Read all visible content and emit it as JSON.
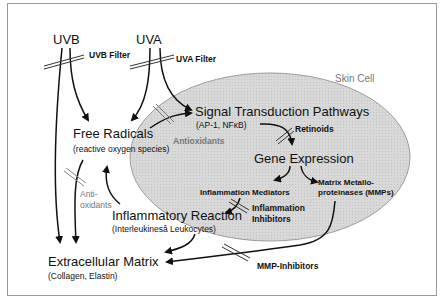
{
  "diagram": {
    "container_label": "Skin Cell",
    "colors": {
      "cell_fill": "#d6d6d6",
      "cell_stroke": "#9c9c9c",
      "arrow": "#111111",
      "inhibitor_text": "#222222",
      "antioxidant_text": "#7a7a7a"
    },
    "sources": {
      "uvb": "UVB",
      "uva": "UVA"
    },
    "nodes": {
      "free_radicals": {
        "title": "Free Radicals",
        "subtitle": "(reactive oxygen species)"
      },
      "signal_transduction": {
        "title": "Signal Transduction Pathways",
        "subtitle": "(AP-1, NFκB)"
      },
      "gene_expression": {
        "title": "Gene Expression"
      },
      "inflammation_mediators": {
        "title": "Inflammation Mediators"
      },
      "mmps": {
        "title_line1": "Matrix Metallo-",
        "title_line2": "proteinases (MMPs)"
      },
      "inflammatory_reaction": {
        "title": "Inflammatory Reaction",
        "subtitle": "(Interleukinesâ Leukocytes)"
      },
      "extracellular_matrix": {
        "title": "Extracellular Matrix",
        "subtitle": "(Collagen, Elastin)"
      }
    },
    "inhibitors": {
      "uvb_filter": "UVB Filter",
      "uva_filter": "UVA Filter",
      "antioxidants_cell": "Antioxidants",
      "antioxidants_outside_line1": "Anti-",
      "antioxidants_outside_line2": "oxidants",
      "retinoids": "Retinoids",
      "inflammation_inhibitors_line1": "Inflammation",
      "inflammation_inhibitors_line2": "Inhibitors",
      "mmp_inhibitors": "MMP-Inhibitors"
    }
  }
}
